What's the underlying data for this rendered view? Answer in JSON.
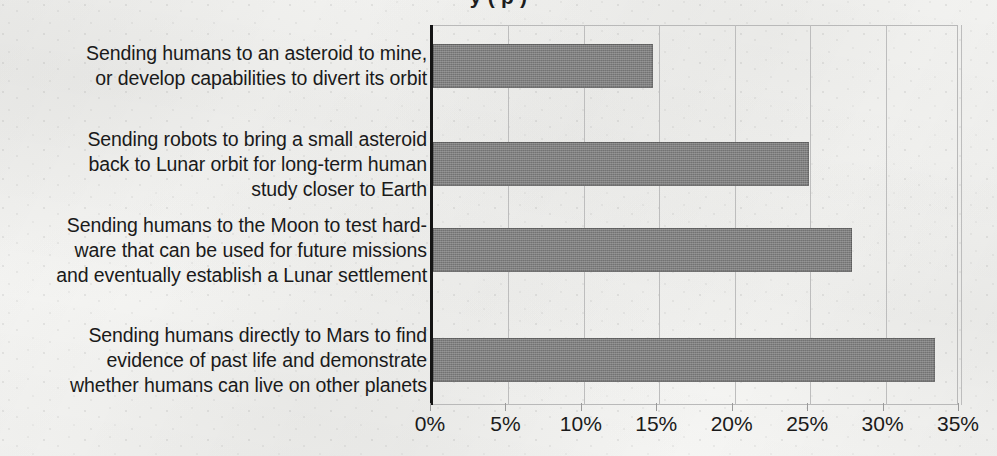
{
  "chart_data": {
    "type": "bar",
    "orientation": "horizontal",
    "title": "y (                p        )",
    "title_note": "Chart title is cropped off the top edge of the scan; only descender fragments are visible.",
    "xlabel": "",
    "ylabel": "",
    "categories": [
      "Sending humans to an asteroid to mine, or develop capabilities to divert its orbit",
      "Sending robots to bring a small asteroid back to Lunar orbit for long-term human study closer to Earth",
      "Sending humans to the Moon to test hard-ware that can be used for future missions and eventually establish a Lunar settlement",
      "Sending humans directly to Mars to find evidence of past life and demonstrate whether humans can live on other planets"
    ],
    "category_lines": [
      [
        "Sending humans to an asteroid to mine,",
        "or develop capabilities to divert its orbit"
      ],
      [
        "Sending robots to bring a small asteroid",
        "back to Lunar orbit for long-term human",
        "study closer to Earth"
      ],
      [
        "Sending humans to the Moon to test hard-",
        "ware that can be used for future missions",
        "and eventually establish a Lunar settlement"
      ],
      [
        "Sending humans directly to Mars to find",
        "evidence of past life and demonstrate",
        "whether humans can live on other planets"
      ]
    ],
    "values": [
      14.6,
      24.9,
      27.8,
      33.3
    ],
    "value_labels": [
      "14.6%",
      "24.9%",
      "27.8%",
      "33.3%"
    ],
    "xlim": [
      0,
      35
    ],
    "xticks": [
      0,
      5,
      10,
      15,
      20,
      25,
      30,
      35
    ],
    "xtick_labels": [
      "0%",
      "5%",
      "10%",
      "15%",
      "20%",
      "25%",
      "30%",
      "35%"
    ],
    "grid": "vertical",
    "legend": "none",
    "bar_color": "#7f7f7f",
    "axis_color": "#141414",
    "gridline_color": "#bdbdbd",
    "text_color": "#1a1a1a",
    "background_color": "#f7f7f5"
  }
}
